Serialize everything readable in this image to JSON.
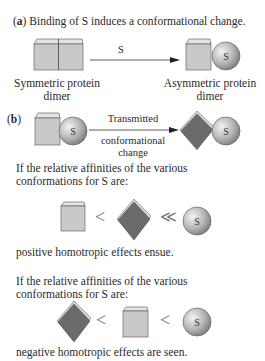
{
  "panel_a": {
    "label": "a",
    "title": "Binding of S induces a conformational change.",
    "arrow_label": "S",
    "left_caption_line1": "Symmetric protein",
    "left_caption_line2": "dimer",
    "right_caption_line1": "Asymmetric protein",
    "right_caption_line2": "dimer"
  },
  "panel_b": {
    "label": "b",
    "arrow_label_line1": "Transmitted",
    "arrow_label_line2": "conformational",
    "arrow_label_line3": "change",
    "ligand_symbol": "S",
    "case1": {
      "intro_line1": "If the relative affinities of the various",
      "intro_line2": "conformations for S are:",
      "symbol1": "<",
      "symbol2": "≪",
      "conclusion": "positive homotropic effects ensue."
    },
    "case2": {
      "intro_line1": "If the relative affinities of the various",
      "intro_line2": "conformations for S are:",
      "symbol1": "<",
      "symbol2": "<",
      "conclusion": "negative homotropic effects are seen."
    }
  },
  "colors": {
    "cube_face": "#c9c9c9",
    "cube_top": "#e4e4e4",
    "diamond_face": "#6b6b6b",
    "diamond_edge": "#d8d8d8",
    "sphere_light": "#eeeeee",
    "sphere_dark": "#8a8a8a",
    "text": "#2a2a2a"
  }
}
